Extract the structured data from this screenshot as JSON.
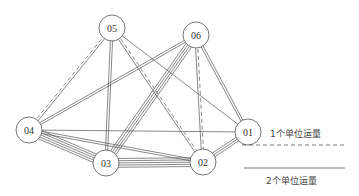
{
  "diagram": {
    "type": "network-flow-graph",
    "nodes": [
      {
        "id": "01",
        "label": "01",
        "x": 248,
        "y": 132,
        "r": 13
      },
      {
        "id": "02",
        "label": "02",
        "x": 203,
        "y": 162,
        "r": 13
      },
      {
        "id": "03",
        "label": "03",
        "x": 106,
        "y": 163,
        "r": 13
      },
      {
        "id": "04",
        "label": "04",
        "x": 29,
        "y": 130,
        "r": 13
      },
      {
        "id": "05",
        "label": "05",
        "x": 112,
        "y": 28,
        "r": 13
      },
      {
        "id": "06",
        "label": "06",
        "x": 196,
        "y": 35,
        "r": 13
      }
    ],
    "edges": [
      {
        "from": "04",
        "to": "05",
        "solid": 1,
        "dashed": 1
      },
      {
        "from": "04",
        "to": "06",
        "solid": 2,
        "dashed": 0
      },
      {
        "from": "04",
        "to": "01",
        "solid": 1,
        "dashed": 0
      },
      {
        "from": "04",
        "to": "02",
        "solid": 2,
        "dashed": 0
      },
      {
        "from": "04",
        "to": "03",
        "solid": 5,
        "dashed": 0
      },
      {
        "from": "05",
        "to": "03",
        "solid": 2,
        "dashed": 0
      },
      {
        "from": "05",
        "to": "02",
        "solid": 1,
        "dashed": 1
      },
      {
        "from": "05",
        "to": "01",
        "solid": 1,
        "dashed": 0
      },
      {
        "from": "06",
        "to": "03",
        "solid": 4,
        "dashed": 0
      },
      {
        "from": "06",
        "to": "02",
        "solid": 1,
        "dashed": 1
      },
      {
        "from": "06",
        "to": "01",
        "solid": 2,
        "dashed": 0
      },
      {
        "from": "03",
        "to": "02",
        "solid": 5,
        "dashed": 0
      },
      {
        "from": "02",
        "to": "01",
        "solid": 3,
        "dashed": 0
      }
    ]
  },
  "legend": {
    "items": [
      {
        "label": "1个单位运量",
        "style": "dashed"
      },
      {
        "label": "2个单位运量",
        "style": "solid"
      }
    ]
  },
  "colors": {
    "line": "#555555",
    "node_stroke": "#555555",
    "node_fill": "#ffffff"
  }
}
